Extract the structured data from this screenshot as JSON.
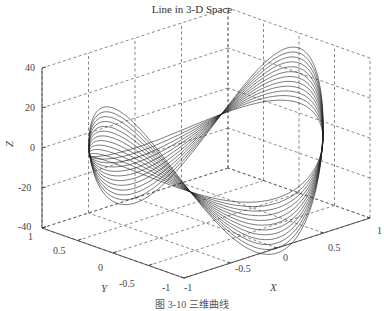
{
  "figure": {
    "title": "Line in 3-D Space",
    "caption": "图 3-10  三维曲线"
  },
  "chart_data": {
    "type": "line3d",
    "title": "Line in 3-D Space",
    "xlabel": "X",
    "ylabel": "Y",
    "zlabel": "Z",
    "xlim": [
      -1,
      1
    ],
    "ylim": [
      -1,
      1
    ],
    "zlim": [
      -40,
      40
    ],
    "xticks": [
      "-1",
      "-0.5",
      "0",
      "0.5",
      "1"
    ],
    "yticks": [
      "-1",
      "-0.5",
      "0",
      "0.5",
      "1"
    ],
    "zticks": [
      "-40",
      "-20",
      "0",
      "20",
      "40"
    ],
    "grid": true,
    "grid_style": "dashed",
    "legend": null,
    "series_count": 12,
    "curve_amplitudes": [
      10,
      12.5,
      15,
      17.5,
      20,
      22.5,
      25,
      27.5,
      30,
      32.5,
      35,
      37.5
    ]
  },
  "axes": {
    "z": {
      "label": "Z",
      "ticks": [
        "40",
        "20",
        "0",
        "-20",
        "-40"
      ]
    },
    "y": {
      "label": "Y",
      "ticks": [
        "1",
        "0.5",
        "0",
        "-0.5",
        "-1"
      ]
    },
    "x": {
      "label": "X",
      "ticks": [
        "-1",
        "-0.5",
        "0",
        "0.5",
        "1"
      ]
    }
  }
}
